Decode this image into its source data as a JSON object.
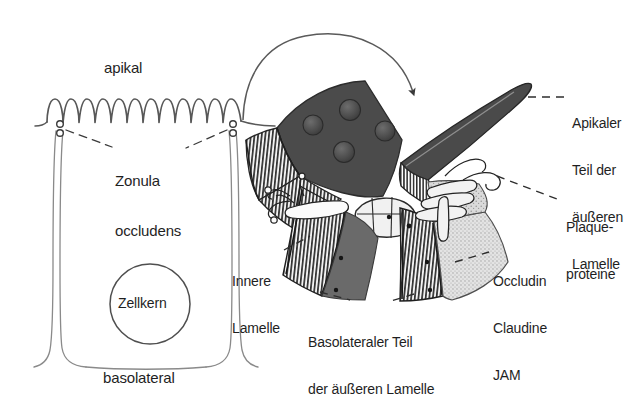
{
  "figure": {
    "language": "de",
    "background_color": "#ffffff",
    "ink_color": "#1f1f1f",
    "membrane_dark_color": "#474747",
    "membrane_mid_color": "#6e6e6e",
    "membrane_light_color": "#cfcfcf",
    "stipple_color": "#b8b8b8"
  },
  "cell_panel": {
    "apical_label": "apikal",
    "basolateral_label": "basolateral",
    "nucleus_label": "Zellkern",
    "junction_label_line1": "Zonula",
    "junction_label_line2": "occludens",
    "microvilli_count": 11
  },
  "detail_panel": {
    "labels": {
      "apical_outer_lamella": {
        "lines": [
          "Apikaler",
          "Teil der",
          "äußeren",
          "Lamelle"
        ],
        "text": "Apikaler Teil der äußeren Lamelle"
      },
      "plaque_proteins": {
        "lines": [
          "Plaque-",
          "proteine"
        ],
        "text": "Plaqueproteine"
      },
      "transmembrane_proteins": {
        "lines": [
          "Occludin",
          "Claudine",
          "JAM"
        ],
        "text": "Occludin Claudine JAM"
      },
      "inner_lamella": {
        "lines": [
          "Innere",
          "Lamelle"
        ],
        "text": "Innere Lamelle"
      },
      "basolateral_outer_lamella": {
        "lines": [
          "Basolateraler Teil",
          "der äußeren Lamelle"
        ],
        "text": "Basolateraler Teil der äußeren Lamelle"
      }
    },
    "callout_arrow": "curved-arrow-from-cell-to-detail",
    "particle_count": 4
  }
}
